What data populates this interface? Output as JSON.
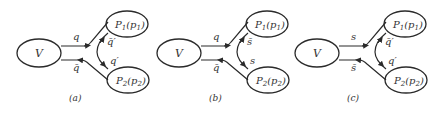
{
  "figure": {
    "stroke_color": "#2a2a2a",
    "panels": [
      {
        "id": "a",
        "offset_x": 0,
        "caption": "(a)",
        "source_label": "V",
        "upper_line_label": "q",
        "lower_line_label": "q̄",
        "upper_loop_label": "q̄′",
        "lower_loop_label": "q′",
        "p1_label_main": "P",
        "p1_label_sub": "1",
        "p1_label_arg": "p",
        "p1_label_arg_sub": "1",
        "p2_label_main": "P",
        "p2_label_sub": "2",
        "p2_label_arg": "p",
        "p2_label_arg_sub": "2"
      },
      {
        "id": "b",
        "offset_x": 140,
        "caption": "(b)",
        "source_label": "V",
        "upper_line_label": "q",
        "lower_line_label": "q̄",
        "upper_loop_label": "s̄",
        "lower_loop_label": "s",
        "p1_label_main": "P",
        "p1_label_sub": "1",
        "p1_label_arg": "p",
        "p1_label_arg_sub": "1",
        "p2_label_main": "P",
        "p2_label_sub": "2",
        "p2_label_arg": "p",
        "p2_label_arg_sub": "2"
      },
      {
        "id": "c",
        "offset_x": 278,
        "caption": "(c)",
        "source_label": "V",
        "upper_line_label": "s",
        "lower_line_label": "s̄",
        "upper_loop_label": "q̄′",
        "lower_loop_label": "q′",
        "p1_label_main": "P",
        "p1_label_sub": "1",
        "p1_label_arg": "p",
        "p1_label_arg_sub": "1",
        "p2_label_main": "P",
        "p2_label_sub": "2",
        "p2_label_arg": "p",
        "p2_label_arg_sub": "2"
      }
    ]
  }
}
